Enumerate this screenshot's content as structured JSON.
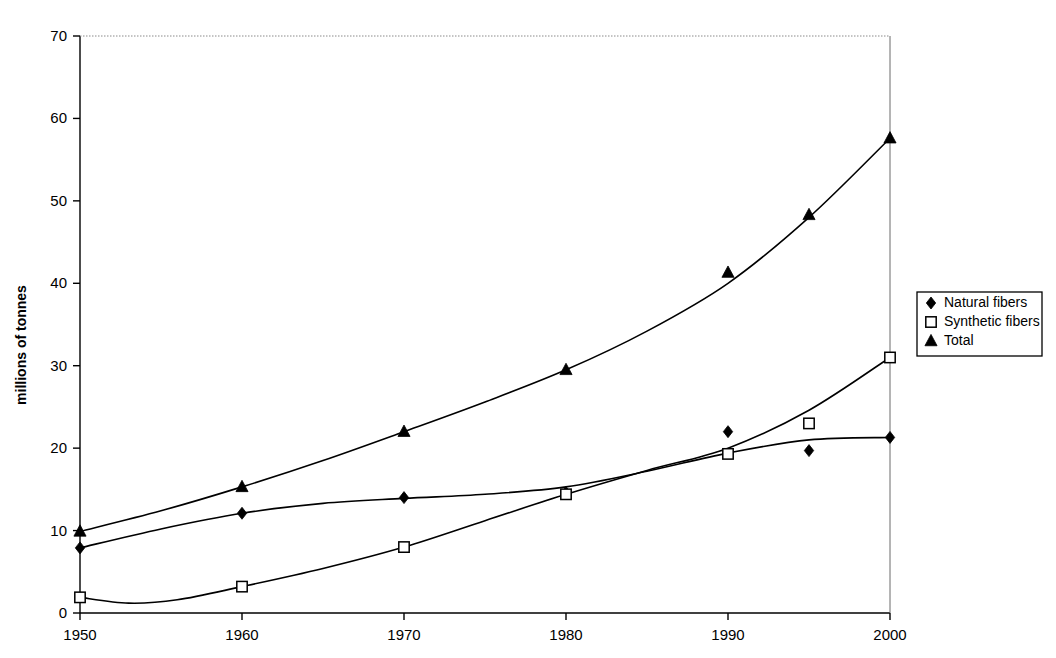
{
  "chart_data": {
    "type": "line",
    "title": "",
    "subtitle": "",
    "xlabel": "",
    "ylabel": "millions of tonnes",
    "xlim": [
      1950,
      2000
    ],
    "ylim": [
      0,
      70
    ],
    "x_ticks": [
      "1950",
      "1960",
      "1970",
      "1980",
      "1990",
      "2000"
    ],
    "x_tick_values": [
      1950,
      1960,
      1970,
      1980,
      1990,
      2000
    ],
    "y_ticks": [
      "0",
      "10",
      "20",
      "30",
      "40",
      "50",
      "60",
      "70"
    ],
    "y_tick_values": [
      0,
      10,
      20,
      30,
      40,
      50,
      60,
      70
    ],
    "grid": false,
    "legend_position": "right",
    "x": [
      1950,
      1960,
      1970,
      1980,
      1990,
      1995,
      2000
    ],
    "series": [
      {
        "name": "Natural fibers",
        "marker": "filled-diamond",
        "color": "#000000",
        "values": [
          7.9,
          12.1,
          14.0,
          14.6,
          22.0,
          19.7,
          21.3
        ]
      },
      {
        "name": "Synthetic fibers",
        "marker": "open-square",
        "color": "#000000",
        "values": [
          1.9,
          3.2,
          8.0,
          14.4,
          19.3,
          23.0,
          31.0
        ]
      },
      {
        "name": "Total",
        "marker": "filled-triangle",
        "color": "#000000",
        "values": [
          9.9,
          15.3,
          22.0,
          29.5,
          41.3,
          48.3,
          57.6
        ]
      }
    ],
    "trend_curves": {
      "note": "smooth fitted curves drawn through the scatter for each series",
      "natural_fibers": [
        [
          1950,
          7.9
        ],
        [
          1955,
          10.2
        ],
        [
          1960,
          12.1
        ],
        [
          1965,
          13.3
        ],
        [
          1970,
          13.9
        ],
        [
          1975,
          14.4
        ],
        [
          1980,
          15.3
        ],
        [
          1985,
          17.2
        ],
        [
          1990,
          19.4
        ],
        [
          1995,
          21.0
        ],
        [
          2000,
          21.3
        ]
      ],
      "synthetic_fibers": [
        [
          1950,
          1.9
        ],
        [
          1953,
          1.2
        ],
        [
          1956,
          1.6
        ],
        [
          1960,
          3.2
        ],
        [
          1965,
          5.4
        ],
        [
          1970,
          8.0
        ],
        [
          1975,
          11.2
        ],
        [
          1980,
          14.4
        ],
        [
          1985,
          17.3
        ],
        [
          1990,
          20.0
        ],
        [
          1995,
          24.6
        ],
        [
          2000,
          31.0
        ]
      ],
      "total": [
        [
          1950,
          9.9
        ],
        [
          1955,
          12.4
        ],
        [
          1960,
          15.3
        ],
        [
          1965,
          18.5
        ],
        [
          1970,
          22.0
        ],
        [
          1975,
          25.6
        ],
        [
          1980,
          29.5
        ],
        [
          1985,
          34.2
        ],
        [
          1990,
          40.0
        ],
        [
          1995,
          48.0
        ],
        [
          2000,
          57.6
        ]
      ]
    }
  },
  "legend": {
    "items": [
      {
        "label": "Natural fibers",
        "marker": "filled-diamond"
      },
      {
        "label": "Synthetic fibers",
        "marker": "open-square"
      },
      {
        "label": "Total",
        "marker": "filled-triangle"
      }
    ]
  },
  "axes": {
    "y_title": "millions of tonnes"
  }
}
